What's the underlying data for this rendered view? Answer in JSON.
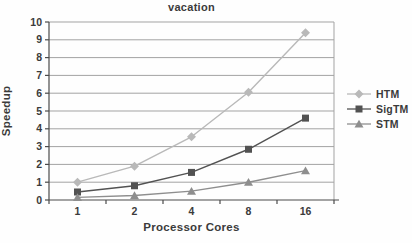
{
  "chart_data": {
    "type": "line",
    "title": "vacation",
    "xlabel": "Processor Cores",
    "ylabel": "Speedup",
    "categories": [
      "1",
      "2",
      "4",
      "8",
      "16"
    ],
    "ylim": [
      0,
      10
    ],
    "ytick_step": 1,
    "grid": "horizontal",
    "legend_position": "right",
    "grid_color": "#a3a3a3",
    "axis_color": "#4a4a4a",
    "text_color": "#3b3b3b",
    "background_color": "#fefefe",
    "series": [
      {
        "name": "HTM",
        "marker": "diamond",
        "color": "#b9b9b9",
        "values": [
          1.0,
          1.9,
          3.55,
          6.05,
          9.4
        ]
      },
      {
        "name": "SigTM",
        "marker": "square",
        "color": "#525252",
        "values": [
          0.45,
          0.8,
          1.55,
          2.85,
          4.6
        ]
      },
      {
        "name": "STM",
        "marker": "triangle",
        "color": "#8e8e8e",
        "values": [
          0.15,
          0.25,
          0.5,
          1.0,
          1.65
        ]
      }
    ]
  }
}
